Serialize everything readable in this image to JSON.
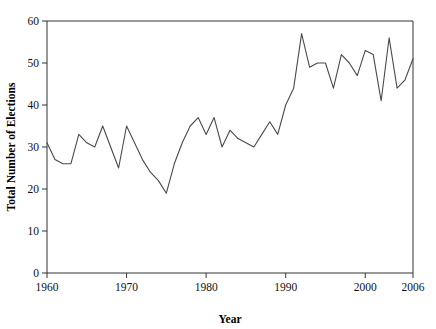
{
  "chart_data": {
    "type": "line",
    "title": "",
    "xlabel": "Year",
    "ylabel": "Total Number of Elections",
    "xlim": [
      1960,
      2006
    ],
    "ylim": [
      0,
      60
    ],
    "grid": false,
    "legend": null,
    "xticks": [
      1960,
      1970,
      1980,
      1990,
      2000,
      2006
    ],
    "xtick_labels": [
      "1960",
      "1970",
      "1980",
      "1990",
      "2000",
      "2006"
    ],
    "yticks": [
      0,
      10,
      20,
      30,
      40,
      50,
      60
    ],
    "ytick_labels": [
      "0",
      "10",
      "20",
      "30",
      "40",
      "50",
      "60"
    ],
    "line_color": "#4a4a4a",
    "x": [
      1960,
      1961,
      1962,
      1963,
      1964,
      1965,
      1966,
      1967,
      1968,
      1969,
      1970,
      1971,
      1972,
      1973,
      1974,
      1975,
      1976,
      1977,
      1978,
      1979,
      1980,
      1981,
      1982,
      1983,
      1984,
      1985,
      1986,
      1987,
      1988,
      1989,
      1990,
      1991,
      1992,
      1993,
      1994,
      1995,
      1996,
      1997,
      1998,
      1999,
      2000,
      2001,
      2002,
      2003,
      2004,
      2005,
      2006
    ],
    "values": [
      31,
      27,
      26,
      26,
      33,
      31,
      30,
      35,
      30,
      25,
      35,
      31,
      27,
      24,
      22,
      19,
      26,
      31,
      35,
      37,
      33,
      37,
      30,
      34,
      32,
      31,
      30,
      33,
      36,
      33,
      40,
      44,
      57,
      49,
      50,
      50,
      44,
      52,
      50,
      47,
      53,
      52,
      41,
      56,
      44,
      46,
      51
    ]
  },
  "axis": {
    "x_title": "Year",
    "y_title": "Total Number of Elections"
  }
}
